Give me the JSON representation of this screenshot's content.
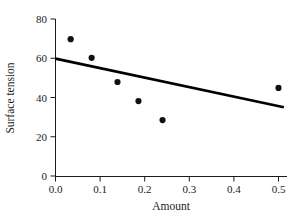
{
  "chart_data": {
    "type": "scatter",
    "title": "",
    "subtitle": "",
    "xlabel": "Amount",
    "ylabel": "Surface tension",
    "xlim": [
      0.0,
      0.53
    ],
    "ylim": [
      0,
      82
    ],
    "grid": false,
    "legend": null,
    "x_ticks": [
      0.0,
      0.1,
      0.2,
      0.3,
      0.4,
      0.5
    ],
    "x_tick_labels": [
      "0.0",
      "0.1",
      "0.2",
      "0.3",
      "0.4",
      "0.5"
    ],
    "y_ticks": [
      0,
      20,
      40,
      60,
      80
    ],
    "y_tick_labels": [
      "0",
      "20",
      "40",
      "60",
      "80"
    ],
    "x": [
      0.034,
      0.081,
      0.139,
      0.186,
      0.24,
      0.5
    ],
    "y": [
      69.7,
      60.2,
      47.9,
      38.2,
      28.5,
      44.9
    ],
    "points": [
      {
        "x": 0.034,
        "y": 69.7
      },
      {
        "x": 0.081,
        "y": 60.2
      },
      {
        "x": 0.139,
        "y": 47.9
      },
      {
        "x": 0.186,
        "y": 38.2
      },
      {
        "x": 0.24,
        "y": 28.5
      },
      {
        "x": 0.5,
        "y": 44.9
      }
    ],
    "marker": {
      "shape": "circle",
      "size": 3.1,
      "color": "#111111"
    },
    "fit_line": {
      "type": "line",
      "label": "",
      "color": "#000000",
      "width": 2.6,
      "x_start": 0.0,
      "y_start": 59.8,
      "x_end": 0.512,
      "y_end": 35.0
    },
    "axis_color": "#1a1a1a",
    "background_color": "#ffffff"
  },
  "axes": {
    "x_title": "Amount",
    "y_title": "Surface tension"
  }
}
